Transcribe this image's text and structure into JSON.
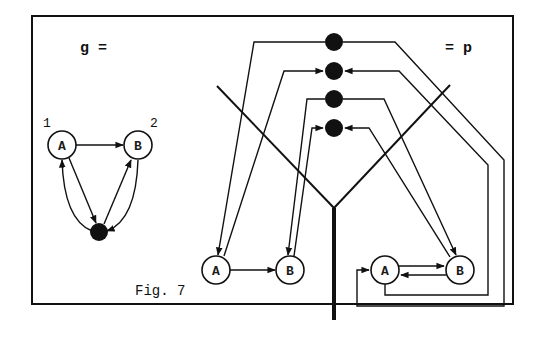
{
  "figure": {
    "caption": "Fig. 7",
    "left_title": "g =",
    "right_title": "= p",
    "colors": {
      "ink": "#111111",
      "paper": "#ffffff"
    }
  },
  "graph_g": {
    "nodes": [
      {
        "id": "A",
        "label": "A",
        "index_label": "1"
      },
      {
        "id": "B",
        "label": "B",
        "index_label": "2"
      },
      {
        "id": "hub",
        "label": "",
        "type": "black-dot"
      }
    ],
    "edges": [
      {
        "from": "A",
        "to": "B"
      },
      {
        "from": "A",
        "to": "hub"
      },
      {
        "from": "hub",
        "to": "A"
      },
      {
        "from": "hub",
        "to": "B"
      },
      {
        "from": "B",
        "to": "hub"
      }
    ]
  },
  "graph_p": {
    "dots": 4,
    "left_component": {
      "nodes": [
        {
          "id": "A",
          "label": "A"
        },
        {
          "id": "B",
          "label": "B"
        }
      ]
    },
    "right_component": {
      "nodes": [
        {
          "id": "A",
          "label": "A"
        },
        {
          "id": "B",
          "label": "B"
        }
      ]
    }
  }
}
